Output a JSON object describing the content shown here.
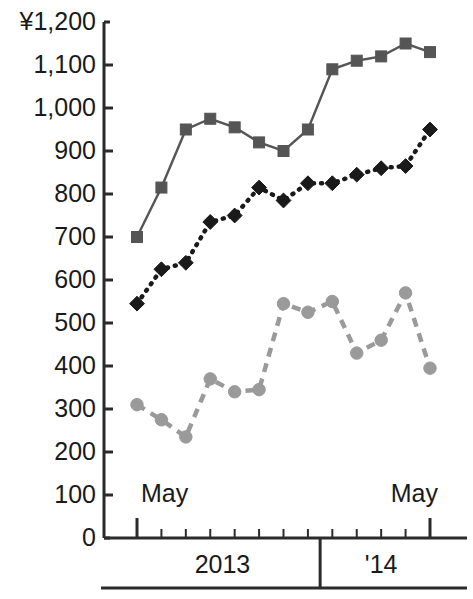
{
  "chart_data": {
    "type": "line",
    "title": "",
    "subtitle": "",
    "xlabel": "",
    "ylabel": "",
    "currency_symbol": "¥",
    "ylim": [
      0,
      1200
    ],
    "ytick_step": 100,
    "grid": false,
    "legend_position": "none",
    "ytick_labels": [
      "¥1,200",
      "1,100",
      "1,000",
      "900",
      "800",
      "700",
      "600",
      "500",
      "400",
      "300",
      "200",
      "100",
      "0"
    ],
    "ytick_values": [
      1200,
      1100,
      1000,
      900,
      800,
      700,
      600,
      500,
      400,
      300,
      200,
      100,
      0
    ],
    "x": [
      "May",
      "Jun",
      "Jul",
      "Aug",
      "Sep",
      "Oct",
      "Nov",
      "Dec",
      "Jan",
      "Feb",
      "Mar",
      "Apr",
      "May"
    ],
    "x_major_labels": [
      {
        "text": "May",
        "index": 0
      },
      {
        "text": "May",
        "index": 12
      }
    ],
    "x_period_labels": [
      {
        "text": "2013",
        "start_index": 0,
        "end_index": 7
      },
      {
        "text": "'14",
        "start_index": 8,
        "end_index": 12
      }
    ],
    "series": [
      {
        "name": "square-series",
        "marker": "square",
        "line_style": "solid",
        "color": "#555555",
        "values": [
          700,
          815,
          950,
          975,
          955,
          920,
          900,
          950,
          1090,
          1110,
          1120,
          1150,
          1130
        ]
      },
      {
        "name": "diamond-series",
        "marker": "diamond",
        "line_style": "dotted",
        "color": "#1a1a1a",
        "values": [
          545,
          625,
          640,
          735,
          750,
          815,
          785,
          825,
          825,
          845,
          860,
          865,
          950
        ]
      },
      {
        "name": "circle-series",
        "marker": "circle",
        "line_style": "dashed",
        "color": "#9a9a9a",
        "values": [
          310,
          275,
          235,
          370,
          340,
          345,
          545,
          525,
          550,
          430,
          460,
          570,
          395
        ]
      }
    ]
  },
  "colors": {
    "axis": "#2b2b2b",
    "text": "#1a1a1a",
    "background": "#ffffff",
    "square_series": "#555555",
    "diamond_series": "#1a1a1a",
    "circle_series": "#9a9a9a"
  }
}
